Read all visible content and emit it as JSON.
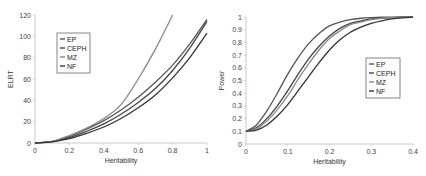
{
  "chart_data": [
    {
      "type": "line",
      "title": "",
      "xlabel": "Heritability",
      "ylabel": "ELRT",
      "xlim": [
        0,
        1
      ],
      "ylim": [
        0,
        120
      ],
      "xticks": [
        "0",
        "0.2",
        "0.4",
        "0.6",
        "0.8",
        "1"
      ],
      "yticks": [
        "0",
        "20",
        "40",
        "60",
        "80",
        "100",
        "120"
      ],
      "grid": false,
      "legend_position": "upper-left",
      "x": [
        0,
        0.1,
        0.2,
        0.3,
        0.4,
        0.5,
        0.6,
        0.7,
        0.8,
        0.9,
        1.0
      ],
      "series": [
        {
          "name": "EP",
          "color": "#555555",
          "values": [
            0,
            1.5,
            6,
            13,
            21,
            31,
            43,
            57,
            73,
            93,
            116
          ]
        },
        {
          "name": "CEPH",
          "color": "#444444",
          "values": [
            0,
            1.2,
            5,
            11,
            18,
            27,
            38,
            51,
            68,
            89,
            114
          ]
        },
        {
          "name": "MZ",
          "color": "#888888",
          "values": [
            0,
            1.6,
            7,
            14,
            23,
            36,
            60,
            88,
            120,
            null,
            null
          ]
        },
        {
          "name": "NF",
          "color": "#333333",
          "values": [
            0,
            1.0,
            4,
            9,
            15,
            23,
            33,
            45,
            61,
            80,
            103
          ]
        }
      ]
    },
    {
      "type": "line",
      "title": "",
      "xlabel": "Heritability",
      "ylabel": "Power",
      "xlim": [
        0,
        0.4
      ],
      "ylim": [
        0,
        1
      ],
      "xticks": [
        "0",
        "0.1",
        "0.2",
        "0.3",
        "0.4"
      ],
      "yticks": [
        "0",
        "0.1",
        "0.2",
        "0.3",
        "0.4",
        "0.5",
        "0.6",
        "0.7",
        "0.8",
        "0.9",
        "1"
      ],
      "grid": false,
      "legend_position": "center-right",
      "x": [
        0,
        0.025,
        0.05,
        0.075,
        0.1,
        0.125,
        0.15,
        0.175,
        0.2,
        0.225,
        0.25,
        0.275,
        0.3,
        0.325,
        0.35,
        0.375,
        0.4
      ],
      "series": [
        {
          "name": "EP",
          "color": "#555555",
          "values": [
            0.1,
            0.15,
            0.26,
            0.4,
            0.55,
            0.68,
            0.79,
            0.87,
            0.93,
            0.96,
            0.98,
            0.99,
            0.995,
            0.998,
            0.999,
            1.0,
            1.0
          ]
        },
        {
          "name": "CEPH",
          "color": "#444444",
          "values": [
            0.1,
            0.13,
            0.2,
            0.3,
            0.42,
            0.55,
            0.67,
            0.77,
            0.85,
            0.91,
            0.95,
            0.97,
            0.985,
            0.99,
            0.995,
            0.998,
            1.0
          ]
        },
        {
          "name": "MZ",
          "color": "#888888",
          "values": [
            0.1,
            0.12,
            0.18,
            0.27,
            0.38,
            0.51,
            0.63,
            0.74,
            0.83,
            0.89,
            0.94,
            0.96,
            0.98,
            0.99,
            0.995,
            0.998,
            1.0
          ]
        },
        {
          "name": "NF",
          "color": "#333333",
          "values": [
            0.1,
            0.11,
            0.15,
            0.22,
            0.31,
            0.42,
            0.53,
            0.64,
            0.74,
            0.82,
            0.88,
            0.92,
            0.95,
            0.97,
            0.985,
            0.993,
            0.998
          ]
        }
      ]
    }
  ],
  "charts": {
    "left": {
      "ylabel": "ELRT",
      "xlabel": "Heritability",
      "legend": [
        "EP",
        "CEPH",
        "MZ",
        "NF"
      ]
    },
    "right": {
      "ylabel": "Power",
      "xlabel": "Heritability",
      "legend": [
        "EP",
        "CEPH",
        "MZ",
        "NF"
      ]
    }
  }
}
